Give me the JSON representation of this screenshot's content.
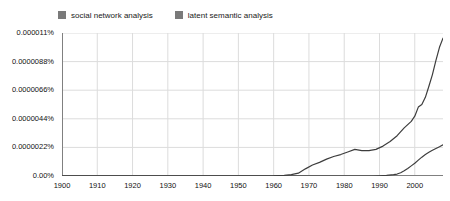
{
  "chart_data": {
    "type": "line",
    "title": "",
    "subtitle": "",
    "xlabel": "",
    "ylabel": "",
    "grid": true,
    "legend_position": "top-left",
    "xlim": [
      1900,
      2008
    ],
    "ylim": [
      0,
      1.1e-05
    ],
    "x_ticks": [
      1900,
      1910,
      1920,
      1930,
      1940,
      1950,
      1960,
      1970,
      1980,
      1990,
      2000
    ],
    "x_tick_labels": [
      "1900",
      "1910",
      "1920",
      "1930",
      "1940",
      "1950",
      "1960",
      "1970",
      "1980",
      "1990",
      "2000"
    ],
    "y_ticks": [
      0,
      2.2e-06,
      4.4e-06,
      6.6e-06,
      8.8e-06,
      1.1e-05
    ],
    "y_tick_labels": [
      "0.00%",
      "0.0000022%",
      "0.0000044%",
      "0.0000066%",
      "0.0000088%",
      "0.000011%"
    ],
    "series": [
      {
        "name": "social network analysis",
        "color": "#7a7a7a",
        "line_color": "#3d3d3d",
        "x": [
          1900,
          1910,
          1920,
          1930,
          1940,
          1950,
          1955,
          1960,
          1963,
          1965,
          1967,
          1969,
          1971,
          1973,
          1975,
          1977,
          1979,
          1981,
          1983,
          1985,
          1987,
          1989,
          1991,
          1993,
          1995,
          1997,
          1999,
          2000,
          2001,
          2002,
          2003,
          2004,
          2005,
          2006,
          2007,
          2008
        ],
        "y": [
          0.0,
          0.0,
          0.0,
          0.0,
          0.0,
          0.0,
          0.0,
          2e-08,
          5e-08,
          1e-07,
          2.2e-07,
          5.5e-07,
          8.5e-07,
          1.05e-06,
          1.3e-06,
          1.5e-06,
          1.65e-06,
          1.85e-06,
          2.05e-06,
          1.95e-06,
          1.95e-06,
          2.05e-06,
          2.3e-06,
          2.65e-06,
          3.1e-06,
          3.7e-06,
          4.2e-06,
          4.6e-06,
          5.3e-06,
          5.5e-06,
          6.05e-06,
          6.9e-06,
          7.8e-06,
          8.9e-06,
          9.9e-06,
          1.06e-05
        ]
      },
      {
        "name": "latent semantic analysis",
        "color": "#7a7a7a",
        "line_color": "#3d3d3d",
        "x": [
          1900,
          1950,
          1980,
          1988,
          1990,
          1992,
          1994,
          1995,
          1996,
          1997,
          1998,
          1999,
          2000,
          2001,
          2002,
          2003,
          2004,
          2005,
          2006,
          2007,
          2008
        ],
        "y": [
          0.0,
          0.0,
          0.0,
          0.0,
          2e-08,
          5e-08,
          1e-07,
          1.5e-07,
          2.5e-07,
          4e-07,
          5.8e-07,
          7.8e-07,
          9.8e-07,
          1.22e-06,
          1.45e-06,
          1.65e-06,
          1.82e-06,
          1.98e-06,
          2.12e-06,
          2.25e-06,
          2.4e-06
        ]
      }
    ]
  },
  "legend": {
    "entries": [
      {
        "label": "social network analysis",
        "color": "#7a7a7a"
      },
      {
        "label": "latent semantic analysis",
        "color": "#7a7a7a"
      }
    ]
  },
  "axes": {
    "y_labels": [
      "0.000011%",
      "0.0000088%",
      "0.0000066%",
      "0.0000044%",
      "0.0000022%",
      "0.00%"
    ],
    "x_labels": [
      "1900",
      "1910",
      "1920",
      "1930",
      "1940",
      "1950",
      "1960",
      "1970",
      "1980",
      "1990",
      "2000"
    ]
  },
  "colors": {
    "grid": "#dcdcdc",
    "axis": "#808080",
    "line": "#3d3d3d",
    "text": "#111111",
    "background": "#ffffff"
  }
}
